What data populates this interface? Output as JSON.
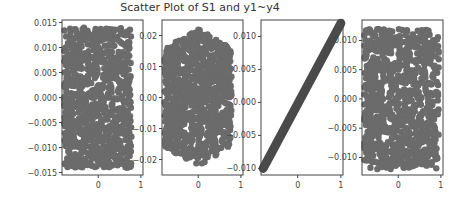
{
  "chart_data": [
    {
      "type": "scatter",
      "title": "Scatter Plot of S1 and y1~y4",
      "panel": "y1",
      "xlabel": "",
      "ylabel": "",
      "xlim": [
        -0.85,
        1.05
      ],
      "ylim": [
        -0.0155,
        0.0155
      ],
      "xticks": [
        "0",
        "1"
      ],
      "yticks": [
        "0.015",
        "0.010",
        "0.005",
        "0.000",
        "-0.005",
        "-0.010",
        "-0.015"
      ],
      "description": "Uniform dense rectangular cloud, x from about -0.8 to 0.8, y from about -0.014 to 0.014; no correlation"
    },
    {
      "type": "scatter",
      "panel": "y2",
      "xlim": [
        -0.85,
        1.05
      ],
      "ylim": [
        -0.025,
        0.025
      ],
      "xticks": [
        "0",
        "1"
      ],
      "yticks": [
        "0.02",
        "0.01",
        "0.00",
        "-0.01",
        "-0.02"
      ],
      "description": "Dense cloud, roughly elliptical, x from -0.8 to 0.8, y from -0.022 to 0.022; no correlation"
    },
    {
      "type": "scatter",
      "panel": "y3",
      "xlim": [
        -0.85,
        1.05
      ],
      "ylim": [
        -0.011,
        0.0125
      ],
      "xticks": [
        "0",
        "1"
      ],
      "yticks": [
        "0.010",
        "0.005",
        "0.000",
        "-0.005",
        "-0.010"
      ],
      "description": "Perfect linear relationship from (-0.8, -0.010) to (1.0, 0.012)"
    },
    {
      "type": "scatter",
      "panel": "y4",
      "xlim": [
        -0.85,
        1.05
      ],
      "ylim": [
        -0.013,
        0.0135
      ],
      "xticks": [
        "0",
        "1"
      ],
      "yticks": [
        "0.010",
        "0.005",
        "0.000",
        "-0.005",
        "-0.010"
      ],
      "description": "Dense cloud, x from -0.8 to 1.0, y from -0.012 to 0.012; no correlation"
    }
  ],
  "title": "Scatter Plot of S1 and y1~y4",
  "colors": {
    "points": "#6b6b6b",
    "line_points": "#4a4a4a",
    "axes": "#444444"
  }
}
